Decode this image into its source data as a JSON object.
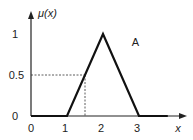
{
  "chart_data": {
    "type": "line",
    "title": "",
    "xlabel": "x",
    "ylabel": "μ(x)",
    "xlim": [
      0,
      4.2
    ],
    "ylim": [
      0,
      1.4
    ],
    "x_ticks": [
      "0",
      "1",
      "2",
      "3"
    ],
    "y_ticks": [
      "0",
      "0.5",
      "1"
    ],
    "grid": false,
    "series": [
      {
        "name": "A",
        "x": [
          0,
          1,
          2,
          3,
          3.8
        ],
        "y": [
          0,
          0,
          1,
          0,
          0
        ]
      }
    ],
    "annotations": [
      {
        "type": "dashed-guide",
        "x": 1.5,
        "y": 0.5
      },
      {
        "type": "label",
        "text": "A",
        "x": 2.8,
        "y": 0.9
      }
    ]
  }
}
